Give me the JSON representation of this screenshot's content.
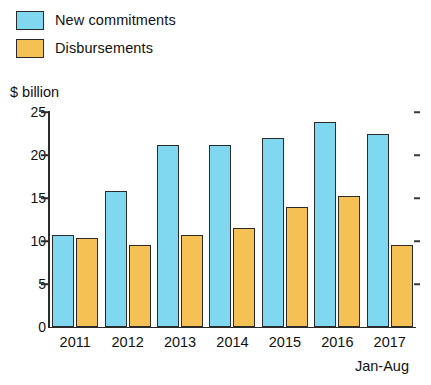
{
  "chart_data": {
    "type": "bar",
    "title": "",
    "subtitle": "",
    "xlabel": "",
    "ylabel": "$ billion",
    "ylim": [
      0,
      25
    ],
    "yticks": [
      0,
      5,
      10,
      15,
      20,
      25
    ],
    "grid": false,
    "legend_position": "top-left",
    "categories": [
      "2011",
      "2012",
      "2013",
      "2014",
      "2015",
      "2016",
      "2017"
    ],
    "annotation": "Jan-Aug",
    "series": [
      {
        "name": "New commitments",
        "color": "#7fd8f0",
        "values": [
          10.7,
          15.8,
          21.2,
          21.2,
          22.0,
          23.8,
          22.4
        ]
      },
      {
        "name": "Disbursements",
        "color": "#f5c054",
        "values": [
          10.3,
          9.5,
          10.7,
          11.5,
          13.9,
          15.2,
          9.5
        ]
      }
    ]
  },
  "legend": {
    "items": [
      {
        "label": "New commitments"
      },
      {
        "label": "Disbursements"
      }
    ]
  },
  "axis": {
    "unit_label": "$ billion",
    "ticks": [
      "25",
      "20",
      "15",
      "10",
      "5",
      "0"
    ],
    "footnote": "Jan-Aug"
  }
}
